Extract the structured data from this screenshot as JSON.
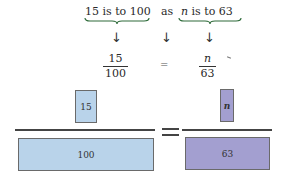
{
  "statement": {
    "left_phrase": "15 is to 100",
    "connector": "as",
    "right_phrase_var": "n",
    "right_phrase_rest": " is to 63"
  },
  "arrows": [
    "↓",
    "↓",
    "↓"
  ],
  "equation": {
    "left": {
      "numerator": "15",
      "denominator": "100"
    },
    "equals": "=",
    "right": {
      "numerator": "n",
      "denominator": "63"
    }
  },
  "bar_model": {
    "left": {
      "numerator": "15",
      "denominator": "100",
      "color": "#b9d3ea"
    },
    "equals": "=",
    "right": {
      "numerator": "n",
      "denominator": "63",
      "color": "#a39fd0"
    }
  },
  "colors": {
    "brace": "#2e6b3a",
    "left_fill": "#b9d3ea",
    "right_fill": "#a39fd0"
  }
}
